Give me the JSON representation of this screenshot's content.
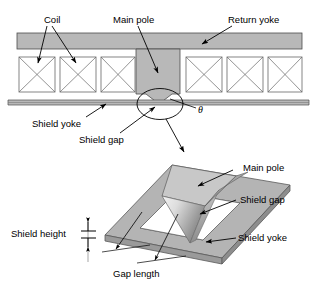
{
  "figure": {
    "colors": {
      "metal_fill": "#b8b8b8",
      "metal_stroke": "#4d4d4d",
      "coil_stroke": "#666666",
      "line": "#000000",
      "pole_light": "#e8e8e8",
      "pole_mid": "#c9c9c9",
      "pole_dark": "#8e8e8e",
      "plate_top": "#b4b4b4",
      "plate_side": "#9a9a9a",
      "background": "#ffffff"
    },
    "cross_section": {
      "labels": {
        "coil": "Coil",
        "main_pole": "Main pole",
        "return_yoke": "Return yoke",
        "shield_yoke": "Shield yoke",
        "shield_gap": "Shield gap",
        "angle": "θ"
      },
      "coil_count_left": 3,
      "coil_count_right": 3,
      "coil_symbol": "cross-hatch-x"
    },
    "perspective_view": {
      "labels": {
        "main_pole": "Main pole",
        "shield_gap": "Shield gap",
        "shield_yoke": "Shield yoke",
        "shield_height": "Shield height",
        "gap_length": "Gap length"
      }
    }
  }
}
